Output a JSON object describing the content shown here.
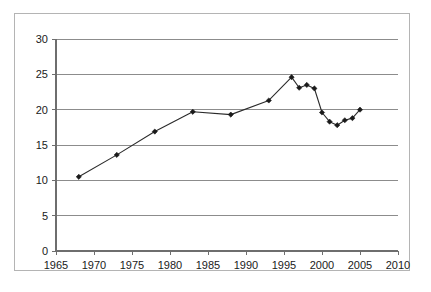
{
  "figure": {
    "border_color": "#b4b4b4",
    "background": "#ffffff"
  },
  "axes": {
    "y_ticks": [
      "0",
      "5",
      "10",
      "15",
      "20",
      "25",
      "30"
    ],
    "x_ticks": [
      "1965",
      "1970",
      "1975",
      "1980",
      "1985",
      "1990",
      "1995",
      "2000",
      "2005",
      "2010"
    ],
    "grid_color": "#8c8c8c",
    "axis_color": "#6e6e6e"
  },
  "series_style": {
    "line_color": "#2b2b2b",
    "marker_color": "#1a1a1a"
  },
  "chart_data": {
    "type": "line",
    "title": "",
    "subtitle": "",
    "xlabel": "",
    "ylabel": "",
    "xlim": [
      1965,
      2010
    ],
    "ylim": [
      0,
      30
    ],
    "x_tick_values": [
      1965,
      1970,
      1975,
      1980,
      1985,
      1990,
      1995,
      2000,
      2005,
      2010
    ],
    "y_tick_values": [
      0,
      5,
      10,
      15,
      20,
      25,
      30
    ],
    "grid": "horizontal",
    "legend": "none",
    "markers": "filled-diamond",
    "series": [
      {
        "name": "series-1",
        "x": [
          1968,
          1973,
          1978,
          1983,
          1988,
          1993,
          1996,
          1997,
          1998,
          1999,
          2000,
          2001,
          2002,
          2003,
          2004,
          2005
        ],
        "values": [
          10.5,
          13.6,
          16.9,
          19.7,
          19.3,
          21.3,
          24.6,
          23.1,
          23.5,
          23.0,
          19.6,
          18.3,
          17.8,
          18.5,
          18.8,
          20.0
        ]
      }
    ]
  }
}
